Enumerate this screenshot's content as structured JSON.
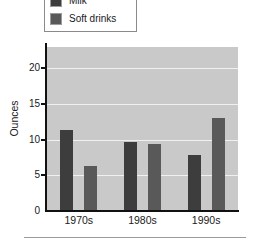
{
  "legend": {
    "position": "top",
    "entries": [
      {
        "label": "Milk",
        "color": "#3d3d3d",
        "swatch_name": "legend-swatch-milk"
      },
      {
        "label": "Soft drinks",
        "color": "#595959",
        "swatch_name": "legend-swatch-soft-drinks"
      }
    ]
  },
  "axes": {
    "y_title": "Ounces",
    "y_ticks": [
      "0",
      "5",
      "10",
      "15",
      "20"
    ],
    "x_ticks": [
      "1970s",
      "1980s",
      "1990s"
    ]
  },
  "colors": {
    "plot_background": "#c9c9c9",
    "gridline": "#f0f0f0",
    "axis": "#111111",
    "milk": "#3d3d3d",
    "soft_drinks": "#595959"
  },
  "chart_data": {
    "type": "bar",
    "title": "",
    "xlabel": "",
    "ylabel": "Ounces",
    "categories": [
      "1970s",
      "1980s",
      "1990s"
    ],
    "series": [
      {
        "name": "Milk",
        "color": "#3d3d3d",
        "values": [
          11.3,
          9.7,
          7.8
        ]
      },
      {
        "name": "Soft drinks",
        "color": "#595959",
        "values": [
          6.3,
          9.4,
          13.0
        ]
      }
    ],
    "ylim": [
      0,
      23
    ],
    "yticks": [
      0,
      5,
      10,
      15,
      20
    ],
    "grid": true,
    "legend_position": "top"
  }
}
